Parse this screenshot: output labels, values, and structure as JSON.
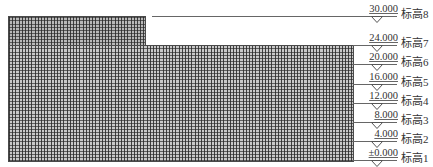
{
  "diagram": {
    "type": "building elevation with level markers",
    "colors": {
      "grid": "#3a3a3a",
      "fill": "#c9c9c9",
      "line": "#666666",
      "text": "#333333"
    },
    "building": {
      "tower": {
        "top_level": "30.000",
        "left": 8,
        "right": 145
      },
      "podium": {
        "top_level": "24.000",
        "left": 8,
        "right": 353
      }
    },
    "levels": [
      {
        "elevation": "30.000",
        "name": "标高8",
        "y": 16,
        "line_from": 152
      },
      {
        "elevation": "24.000",
        "name": "标高7",
        "y": 45,
        "line_from": 353
      },
      {
        "elevation": "20.000",
        "name": "标高6",
        "y": 64,
        "line_from": 353
      },
      {
        "elevation": "16.000",
        "name": "标高5",
        "y": 84,
        "line_from": 353
      },
      {
        "elevation": "12.000",
        "name": "标高4",
        "y": 103,
        "line_from": 353
      },
      {
        "elevation": "8.000",
        "name": "标高3",
        "y": 122,
        "line_from": 353
      },
      {
        "elevation": "4.000",
        "name": "标高2",
        "y": 141,
        "line_from": 353
      },
      {
        "elevation": "±0.000",
        "name": "标高1",
        "y": 160,
        "line_from": 353
      }
    ]
  }
}
